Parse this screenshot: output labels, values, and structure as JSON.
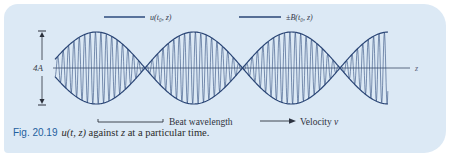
{
  "figure": {
    "legend": [
      {
        "label": "u(t₀, z)",
        "series": "carrier-wave"
      },
      {
        "label": "±B(t₀, z)",
        "series": "envelope"
      }
    ],
    "amplitude_label": "4A",
    "axis_label": "z",
    "beat_wavelength_label": "Beat wavelength",
    "velocity_label": "Velocity ",
    "velocity_symbol": "v",
    "colors": {
      "panel_background": "#dce9f5",
      "wave_stroke": "#2d4a7c",
      "envelope_stroke": "#2a4575",
      "axis_stroke": "#3a4a66",
      "caption_number": "#1f5f9e"
    }
  },
  "caption": {
    "number": "Fig. 20.19",
    "math": "u(t, z)",
    "text_middle": " against ",
    "math_z": "z",
    "text_end": " at a particular time."
  },
  "chart_data": {
    "type": "line",
    "title": "u(t, z) against z at a particular time",
    "xlabel": "z",
    "ylabel": "",
    "series": [
      {
        "name": "u(t₀, z)",
        "description": "high-frequency carrier oscillation modulated by envelope"
      },
      {
        "name": "±B(t₀, z)",
        "description": "beat envelope, |cos| shape, peak-to-peak 4A"
      }
    ],
    "envelope_peaks_count": 3.5,
    "envelope_nodes_count": 3,
    "peak_to_peak_amplitude": "4A",
    "annotations": [
      "Beat wavelength",
      "Velocity v",
      "4A"
    ],
    "grid": false,
    "legend_position": "top"
  }
}
